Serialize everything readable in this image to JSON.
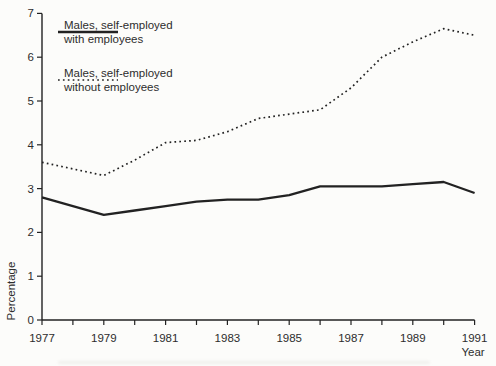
{
  "figure": {
    "background": "#fcfcfa",
    "line_color": "#222222",
    "text_color": "#2d2d2d"
  },
  "legend": {
    "entries": [
      {
        "id": "with-employees",
        "style": "solid",
        "line1": "Males, self-employed",
        "line2": "with employees"
      },
      {
        "id": "without-employees",
        "style": "dotted",
        "line1": "Males, self-employed",
        "line2": "without employees"
      }
    ]
  },
  "chart_data": {
    "type": "line",
    "x": [
      1977,
      1978,
      1979,
      1980,
      1981,
      1982,
      1983,
      1984,
      1985,
      1986,
      1987,
      1988,
      1989,
      1990,
      1991
    ],
    "series": [
      {
        "id": "with-employees",
        "name": "Males, self-employed with employees",
        "style": "solid",
        "values": [
          2.8,
          2.6,
          2.4,
          2.5,
          2.6,
          2.7,
          2.75,
          2.75,
          2.85,
          3.05,
          3.05,
          3.05,
          3.1,
          3.15,
          2.9
        ]
      },
      {
        "id": "without-employees",
        "name": "Males, self-employed without employees",
        "style": "dotted",
        "values": [
          3.6,
          3.45,
          3.3,
          3.65,
          4.05,
          4.1,
          4.3,
          4.6,
          4.7,
          4.8,
          5.3,
          6.0,
          6.35,
          6.65,
          6.5
        ]
      }
    ],
    "xlabel": "Year",
    "ylabel": "Percentage",
    "ylim": [
      0,
      7
    ],
    "yticks": [
      0,
      1,
      2,
      3,
      4,
      5,
      6,
      7
    ],
    "xticks": [
      1977,
      1978,
      1979,
      1980,
      1981,
      1982,
      1983,
      1984,
      1985,
      1986,
      1987,
      1988,
      1989,
      1990,
      1991
    ],
    "xtick_labels": [
      1977,
      1979,
      1981,
      1983,
      1985,
      1987,
      1989,
      1991
    ],
    "grid": false,
    "legend_position": "top-left"
  }
}
